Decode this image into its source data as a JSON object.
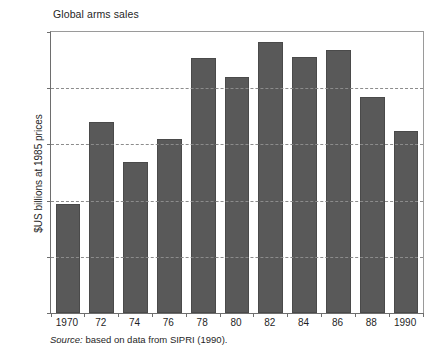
{
  "chart_data": {
    "type": "bar",
    "title": "Global arms sales",
    "xlabel": "",
    "ylabel": "$US billions at 1985 prices",
    "categories": [
      "1970",
      "72",
      "74",
      "76",
      "78",
      "80",
      "82",
      "84",
      "86",
      "88",
      "1990"
    ],
    "values": [
      9.7,
      17.0,
      13.4,
      15.5,
      22.7,
      21.0,
      24.1,
      22.8,
      23.4,
      19.2,
      16.2
    ],
    "ylim": [
      0,
      25
    ],
    "yticks": [
      0,
      5,
      10,
      15,
      20,
      25
    ],
    "ytick_labels": [
      "0",
      "5",
      "10",
      "15",
      "20",
      "25"
    ],
    "grid": "horizontal-dashed",
    "legend": "none",
    "bar_color": "#595959",
    "bar_edge_color": "#4a4a4a",
    "gridline_color": "#8c8c8c",
    "axis_color": "#6e6e6e"
  },
  "source": {
    "prefix": "Source:",
    "text": " based on data from SIPRI (1990)."
  }
}
